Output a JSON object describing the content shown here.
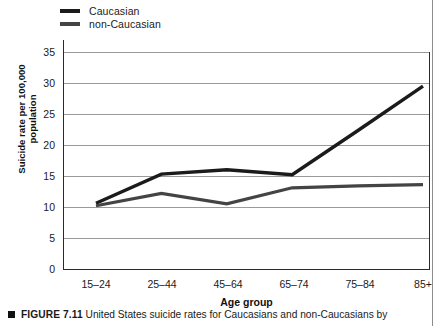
{
  "legend": {
    "items": [
      {
        "label": "Caucasian",
        "color": "#1b1b1b",
        "swatch_name": "legend-swatch-caucasian"
      },
      {
        "label": "non-Caucasian",
        "color": "#444444",
        "swatch_name": "legend-swatch-non-caucasian"
      }
    ]
  },
  "axes": {
    "y_title_line1": "Suicide rate per 100,000",
    "y_title_line2": "population",
    "x_title": "Age group",
    "y_ticks": [
      "35",
      "30",
      "25",
      "20",
      "15",
      "10",
      "5",
      "0"
    ],
    "x_ticks": [
      "15–24",
      "25–44",
      "45–64",
      "65–74",
      "75–84",
      "85+"
    ]
  },
  "caption": {
    "figure_number": "FIGURE 7.11",
    "text": "United States suicide rates for Caucasians and non-Caucasians by"
  },
  "chart_data": {
    "type": "line",
    "title": "",
    "xlabel": "Age group",
    "ylabel": "Suicide rate per 100,000 population",
    "categories": [
      "15–24",
      "25–44",
      "45–64",
      "65–74",
      "75–84",
      "85+"
    ],
    "series": [
      {
        "name": "Caucasian",
        "color": "#1b1b1b",
        "values": [
          10.6,
          15.3,
          16.0,
          15.2,
          22.3,
          29.5
        ]
      },
      {
        "name": "non-Caucasian",
        "color": "#444444",
        "values": [
          10.2,
          12.2,
          10.5,
          13.1,
          13.4,
          13.6
        ]
      }
    ],
    "ylim": [
      0,
      35
    ],
    "ytick_step": 5,
    "grid": true,
    "grid_axis": "y",
    "legend_position": "top-left"
  }
}
